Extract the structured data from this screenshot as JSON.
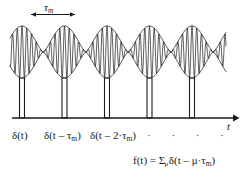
{
  "figure": {
    "caption_elements": {
      "period_label": "τ",
      "period_label_sub": "m",
      "axis_label": "t",
      "delta_0": "δ(t)",
      "delta_1_main": "δ(t – τ",
      "delta_1_sub": "m",
      "delta_1_tail": ")",
      "delta_2_main": "δ(t – 2·τ",
      "delta_2_sub": "m",
      "delta_2_tail": ")",
      "ellipsis_dots": "· · · ·",
      "formula_lead": "f(t) = Σ",
      "formula_index": "μ",
      "formula_body": "δ(t – μ·τ",
      "formula_body_sub": "m",
      "formula_tail": ")"
    },
    "colors": {
      "stroke": "#1a1a1a",
      "background": "#ffffff",
      "pulse_fill": "#ffffff"
    }
  },
  "chart_data": {
    "type": "line",
    "title": "",
    "subtitle": "",
    "xlabel": "t",
    "ylabel": "",
    "grid": false,
    "legend": "none",
    "annotations": [
      {
        "text": "τm",
        "type": "span-arrow",
        "x_start": 30,
        "x_end": 76,
        "y": 14
      },
      {
        "text": "δ(t)",
        "type": "pulse-label",
        "pulse_index": 0
      },
      {
        "text": "δ(t – τm)",
        "type": "pulse-label",
        "pulse_index": 1
      },
      {
        "text": "δ(t – 2·τm)",
        "type": "pulse-label",
        "pulse_index": 2
      },
      {
        "text": "f(t) = Σμ δ(t – μ·τm)",
        "type": "formula"
      }
    ],
    "series": [
      {
        "name": "modulated-carrier",
        "type": "am-burst-train",
        "carrier_cycles_per_lobe": 9,
        "envelope_period_px": 42.5,
        "envelope_peak_y": 26,
        "envelope_waist_y": 52,
        "centerline_y": 52,
        "x_start": 10,
        "x_end": 226,
        "lobe_centers_x": [
          22,
          64.5,
          107,
          149.5,
          192
        ]
      },
      {
        "name": "dirac-comb",
        "type": "pulse-train",
        "baseline_y": 118,
        "pulse_top_y": 78,
        "pulse_width_px": 5,
        "pulse_count": 5,
        "pulse_centers_x": [
          22,
          64.5,
          107,
          149.5,
          192
        ],
        "axis_x_start": 12,
        "axis_x_end": 234
      }
    ],
    "x": [
      0,
      1,
      2,
      3,
      4
    ],
    "values": [
      1,
      1,
      1,
      1,
      1
    ],
    "categories": [
      "δ(t)",
      "δ(t – τm)",
      "δ(t – 2·τm)",
      "δ(t – 3·τm)",
      "δ(t – 4·τm)"
    ]
  }
}
